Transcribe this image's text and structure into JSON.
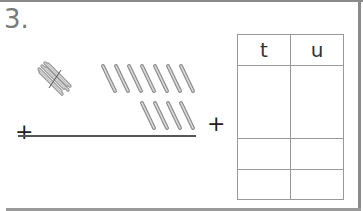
{
  "question": {
    "number": "3."
  },
  "operators": {
    "plus_left": "+",
    "plus_right": "+"
  },
  "manipulatives": {
    "tens_bundles": 1,
    "single_sticks_top_row": 7,
    "single_sticks_bottom_row": 4
  },
  "place_value_table": {
    "headers": [
      "t",
      "u"
    ],
    "rows": [
      [
        "",
        ""
      ],
      [
        "",
        ""
      ],
      [
        "",
        ""
      ]
    ]
  }
}
